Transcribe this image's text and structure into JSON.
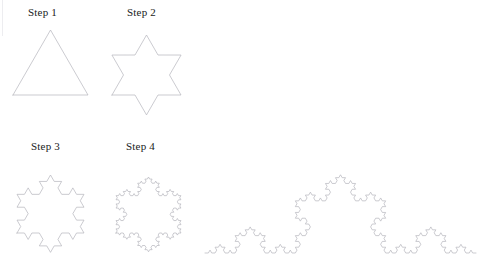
{
  "figure": {
    "background_color": "#ffffff",
    "stroke_color": "#b4b4bc",
    "stroke_width": 0.7,
    "width": 481,
    "height": 265
  },
  "labels": [
    {
      "text": "Step 1",
      "x": 28,
      "y": 7
    },
    {
      "text": "Step 2",
      "x": 127,
      "y": 7
    },
    {
      "text": "Step 3",
      "x": 31,
      "y": 141
    },
    {
      "text": "Step 4",
      "x": 126,
      "y": 141
    }
  ],
  "chart_data": {
    "type": "diagram",
    "subtype": "koch-snowflake-iterations",
    "shapes": [
      {
        "name": "step-1-triangle",
        "label": "Step 1",
        "kind": "koch-snowflake",
        "iterations": 0,
        "sides": 3,
        "base_left_x": 13,
        "base_left_y": 95,
        "base_right_x": 88,
        "base_right_y": 95,
        "apex_x": 50.5,
        "apex_y": 30,
        "side_length": 75
      },
      {
        "name": "step-2-star",
        "label": "Step 2",
        "kind": "koch-snowflake",
        "iterations": 1,
        "sides": 3,
        "base_left_x": 112,
        "base_left_y": 95,
        "base_right_x": 181,
        "base_right_y": 95,
        "apex_x": 146.5,
        "apex_y": 35,
        "side_length": 69
      },
      {
        "name": "step-3-snowflake",
        "label": "Step 3",
        "kind": "koch-snowflake",
        "iterations": 2,
        "sides": 3,
        "base_left_x": 17,
        "base_left_y": 233,
        "base_right_x": 84,
        "base_right_y": 233,
        "apex_x": 50.5,
        "apex_y": 175,
        "side_length": 67
      },
      {
        "name": "step-4-snowflake",
        "label": "Step 4",
        "kind": "koch-snowflake",
        "iterations": 3,
        "sides": 3,
        "base_left_x": 116,
        "base_left_y": 233,
        "base_right_x": 181,
        "base_right_y": 233,
        "apex_x": 148.5,
        "apex_y": 177,
        "side_length": 65
      },
      {
        "name": "large-koch-curve",
        "label": "",
        "kind": "koch-curve",
        "iterations": 4,
        "start_x": 205,
        "start_y": 253,
        "end_x": 476,
        "end_y": 253,
        "apex_x": 340.5,
        "apex_y": 175,
        "base_length": 271
      }
    ]
  }
}
